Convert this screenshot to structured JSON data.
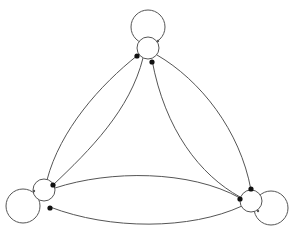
{
  "diagram": {
    "type": "directed-graph",
    "canvas": {
      "width": 295,
      "height": 234,
      "background": "#ffffff"
    },
    "style": {
      "stroke": "#555555",
      "stroke_width": 1,
      "node_fill": "#ffffff",
      "arrow_fill": "#111111",
      "arrow_radius": 2.6
    },
    "nodes": [
      {
        "id": "top",
        "cx": 148,
        "cy": 48,
        "r": 11,
        "self_loop": {
          "cx": 148,
          "cy": 27,
          "r": 17
        }
      },
      {
        "id": "bottom-left",
        "cx": 44,
        "cy": 190,
        "r": 11,
        "self_loop": {
          "cx": 23,
          "cy": 206,
          "r": 17
        }
      },
      {
        "id": "bottom-right",
        "cx": 251,
        "cy": 201,
        "r": 11,
        "self_loop": {
          "cx": 271,
          "cy": 208,
          "r": 17
        }
      }
    ],
    "edges": [
      {
        "id": "top-to-bl-outer",
        "d": "M 138 55 C 100 85, 60 130, 47 180",
        "arrowhead": {
          "x": 137,
          "y": 56
        }
      },
      {
        "id": "bl-to-top-inner",
        "d": "M 53 185 C 90 150, 130 110, 143 58",
        "arrowhead": {
          "x": 53,
          "y": 185
        }
      },
      {
        "id": "top-to-br-outer",
        "d": "M 157 55 C 200 80, 240 130, 251 190",
        "arrowhead": {
          "x": 251,
          "y": 189
        }
      },
      {
        "id": "br-to-top-inner",
        "d": "M 240 197 C 200 175, 165 130, 152 60",
        "arrowhead": {
          "x": 152,
          "y": 62
        }
      },
      {
        "id": "bl-to-br-upper",
        "d": "M 55 188 C 110 170, 190 170, 240 198",
        "arrowhead": {
          "x": 240,
          "y": 199
        }
      },
      {
        "id": "br-to-bl-lower",
        "d": "M 242 206 C 190 230, 110 230, 50 207",
        "arrowhead": {
          "x": 50,
          "y": 208
        }
      }
    ],
    "loop_arrowheads": [
      {
        "node": "top",
        "x": 158,
        "y": 41
      },
      {
        "node": "bottom-left",
        "x": 34,
        "y": 191
      },
      {
        "node": "bottom-right",
        "x": 258,
        "y": 211
      }
    ]
  }
}
